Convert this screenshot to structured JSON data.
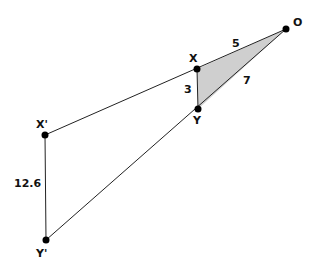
{
  "diagram": {
    "type": "similar-triangles-dilation",
    "colors": {
      "line": "#222222",
      "fill": "#cfcfcf",
      "point": "#000000"
    },
    "points": [
      {
        "id": "O",
        "label": "O",
        "x": 286,
        "y": 29,
        "lx": 293,
        "ly": 23
      },
      {
        "id": "X",
        "label": "X",
        "x": 197,
        "y": 69,
        "lx": 189,
        "ly": 62
      },
      {
        "id": "Y",
        "label": "Y",
        "x": 198,
        "y": 109,
        "lx": 193,
        "ly": 124
      },
      {
        "id": "Xp",
        "label": "X'",
        "x": 45,
        "y": 135,
        "lx": 37,
        "ly": 128
      },
      {
        "id": "Yp",
        "label": "Y'",
        "x": 46,
        "y": 240,
        "lx": 37,
        "ly": 257
      }
    ],
    "segment_labels": [
      {
        "text": "5",
        "x": 232,
        "y": 46
      },
      {
        "text": "7",
        "x": 244,
        "y": 83
      },
      {
        "text": "3",
        "x": 185,
        "y": 92
      },
      {
        "text": "12.6",
        "x": 15,
        "y": 186
      }
    ]
  }
}
